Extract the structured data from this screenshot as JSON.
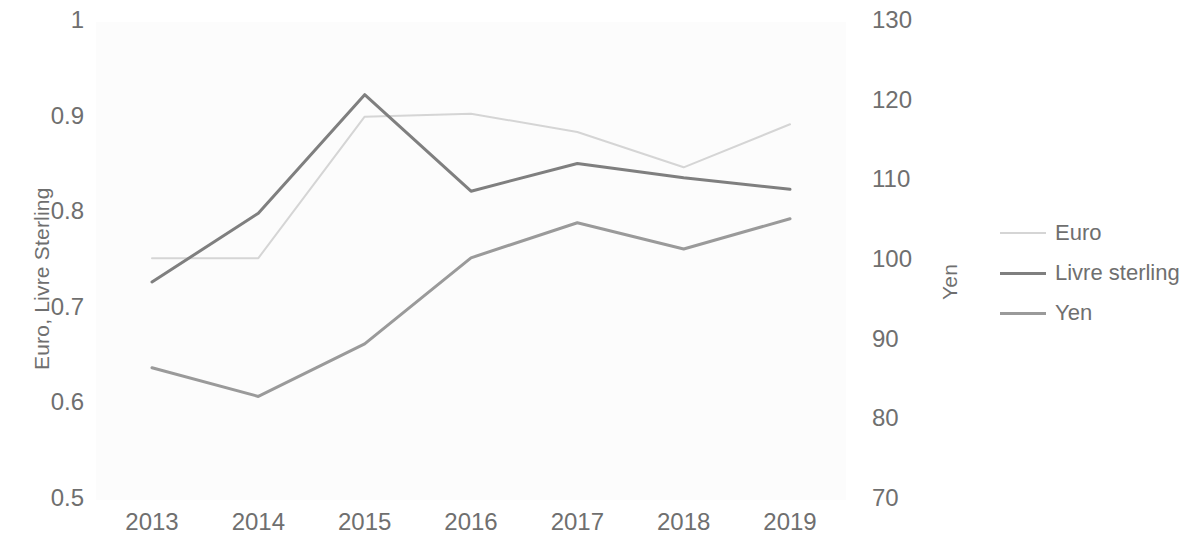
{
  "chart_data": {
    "type": "line",
    "title": "",
    "xlabel": "",
    "categories": [
      "2013",
      "2014",
      "2015",
      "2016",
      "2017",
      "2018",
      "2019"
    ],
    "x": [
      2013,
      2014,
      2015,
      2016,
      2017,
      2018,
      2019
    ],
    "grid": false,
    "legend_position": "right",
    "axes": {
      "left": {
        "label": "Euro, Livre Sterling",
        "ticks": [
          "0.5",
          "0.6",
          "0.7",
          "0.8",
          "0.9",
          "1"
        ],
        "tick_values": [
          0.5,
          0.6,
          0.7,
          0.8,
          0.9,
          1
        ],
        "ylim": [
          0.5,
          1.0
        ]
      },
      "right": {
        "label": "Yen",
        "ticks": [
          "70",
          "80",
          "90",
          "100",
          "110",
          "120",
          "130"
        ],
        "tick_values": [
          70,
          80,
          90,
          100,
          110,
          120,
          130
        ],
        "ylim": [
          70,
          130
        ]
      }
    },
    "series": [
      {
        "name": "Euro",
        "axis": "left",
        "color": "#d5d5d5",
        "width": 2,
        "values": [
          0.753,
          0.753,
          0.901,
          0.904,
          0.885,
          0.848,
          0.893
        ]
      },
      {
        "name": "Livre sterling",
        "axis": "left",
        "color": "#7f7f7f",
        "width": 3,
        "values": [
          0.728,
          0.8,
          0.924,
          0.823,
          0.852,
          0.837,
          0.825
        ]
      },
      {
        "name": "Yen",
        "axis": "right",
        "color": "#9a9a9a",
        "width": 3,
        "values": [
          86.6,
          83.0,
          89.6,
          100.4,
          104.8,
          101.5,
          105.3
        ]
      }
    ]
  },
  "legend": {
    "items": [
      {
        "label": "Euro",
        "color": "#d5d5d5",
        "thickness": 2
      },
      {
        "label": "Livre sterling",
        "color": "#7f7f7f",
        "thickness": 3
      },
      {
        "label": "Yen",
        "color": "#9a9a9a",
        "thickness": 3
      }
    ]
  },
  "colors": {
    "text": "#6f6f6f",
    "plot_background": "#fcfcfc",
    "page_background": "#ffffff"
  }
}
